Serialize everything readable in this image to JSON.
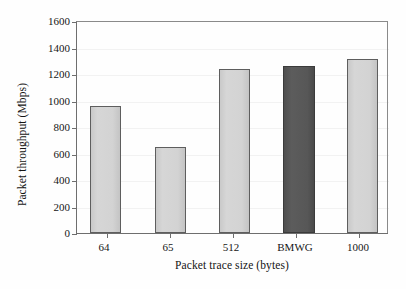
{
  "chart_data": {
    "type": "bar",
    "title": "",
    "categories": [
      "64",
      "65",
      "512",
      "BMWG",
      "1000"
    ],
    "values": [
      965,
      655,
      1245,
      1265,
      1320
    ],
    "series": [
      {
        "name": "Packet throughput",
        "values": [
          965,
          655,
          1245,
          1265,
          1320
        ]
      }
    ],
    "xlabel": "Packet trace size (bytes)",
    "ylabel": "Packet throughput (Mbps)",
    "ylim": [
      0,
      1600
    ],
    "yticks": [
      0,
      200,
      400,
      600,
      800,
      1000,
      1200,
      1400,
      1600
    ],
    "ytick_labels": [
      "0",
      "200",
      "400",
      "600",
      "800",
      "1000",
      "1200",
      "1400",
      "1600"
    ],
    "grid": true,
    "legend": "none",
    "bar_colors": [
      "#d3d3d3",
      "#d3d3d3",
      "#d3d3d3",
      "#565656",
      "#d3d3d3"
    ],
    "bar_edge_color": "#5e5e5e",
    "highlight_category": "BMWG",
    "highlight_color": "#565656",
    "default_bar_color": "#d3d3d3",
    "axis_color": "#6e6e6e",
    "gridline_color": "#f2f2f2",
    "background_color": "#fefefe"
  }
}
